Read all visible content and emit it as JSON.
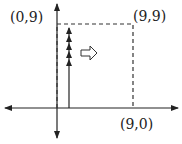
{
  "diagram": {
    "labels": {
      "top_left": "(0,9)",
      "top_right": "(9,9)",
      "bottom_right": "(9,0)"
    },
    "stacked_arrow_count": 5,
    "direction_indicator": "right-hollow-arrow",
    "colors": {
      "stroke": "#222222",
      "dashed": "#333333",
      "background": "#ffffff"
    }
  }
}
